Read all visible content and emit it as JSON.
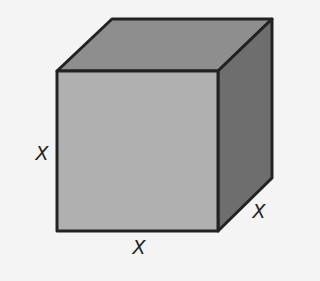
{
  "diagram": {
    "type": "cube",
    "faces": {
      "front": {
        "color": "#b0b0b0"
      },
      "top": {
        "color": "#8e8e8e"
      },
      "side": {
        "color": "#6e6e6e"
      }
    },
    "edge_color": "#222222",
    "labels": {
      "height": "X",
      "width": "X",
      "depth": "X"
    }
  }
}
